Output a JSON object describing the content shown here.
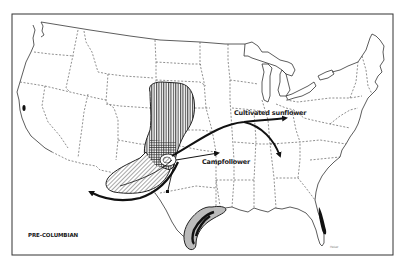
{
  "map": {
    "title": "PRE-COLUMBIAN",
    "region": "United States",
    "frame_color": "#333333",
    "labels": {
      "cultivated_sunflower": "Cultivated sunflower",
      "campfollower": "Campfollower"
    },
    "credit": "Heiser"
  },
  "legend_features": [
    {
      "name": "vertical-hatch-range",
      "pattern": "vertical lines",
      "location": "Great Plains (Nebraska/Kansas/Colorado)"
    },
    {
      "name": "diagonal-hatch-range",
      "pattern": "diagonal lines",
      "location": "Southwest (New Mexico/Arizona)"
    },
    {
      "name": "texas-coast-range",
      "pattern": "gray fill with dark core",
      "location": "South Texas coast"
    },
    {
      "name": "florida-range",
      "pattern": "solid dark",
      "location": "Northeast Florida coast"
    },
    {
      "name": "california-range",
      "pattern": "solid dark",
      "location": "Northern California"
    }
  ],
  "arrows": [
    {
      "name": "sunflower-east-arrow",
      "label": "Cultivated sunflower",
      "direction": "east"
    },
    {
      "name": "sunflower-southeast-arrow",
      "direction": "southeast"
    },
    {
      "name": "campfollower-arrow",
      "label": "Campfollower",
      "direction": "east"
    },
    {
      "name": "southwest-arrow",
      "direction": "southwest"
    },
    {
      "name": "south-arrow",
      "direction": "south"
    }
  ]
}
